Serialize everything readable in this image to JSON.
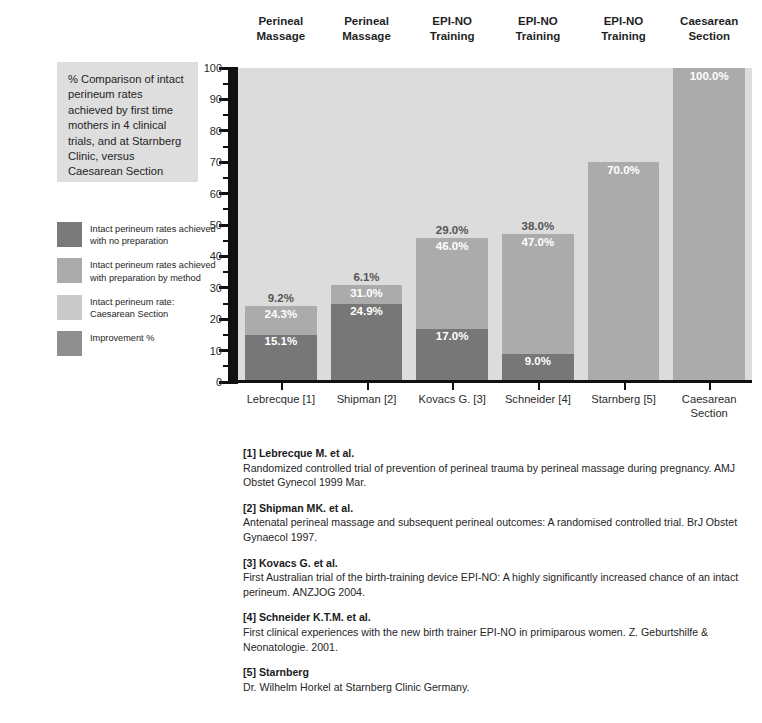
{
  "column_headers": [
    {
      "line1": "Perineal",
      "line2": "Massage"
    },
    {
      "line1": "Perineal",
      "line2": "Massage"
    },
    {
      "line1": "EPI-NO",
      "line2": "Training"
    },
    {
      "line1": "EPI-NO",
      "line2": "Training"
    },
    {
      "line1": "EPI-NO",
      "line2": "Training"
    },
    {
      "line1": "Caesarean",
      "line2": "Section"
    }
  ],
  "title_box": {
    "text": "% Comparison of intact perineum rates achieved by first time mothers in 4 clinical trials, and at Starnberg Clinic, versus Caesarean Section"
  },
  "legend": {
    "items": [
      {
        "label": "Intact perineum rates achieved with no preparation",
        "color": "#7a7a7a"
      },
      {
        "label": "Intact perineum rates achieved with preparation by method",
        "color": "#ababab"
      },
      {
        "label": "Intact perineum rate: Caesarean Section",
        "color": "#c9c9c9"
      },
      {
        "label": "Improvement %",
        "color": "#8f8f8f"
      }
    ]
  },
  "colors": {
    "plot_background": "#dcdcdc",
    "base_segment": "#777777",
    "prepared_segment": "#ababab",
    "axis": "#111111",
    "label_light": "#ffffff",
    "label_dark": "#555555"
  },
  "chart_data": {
    "type": "bar",
    "title": "% Comparison of intact perineum rates achieved by first time mothers in 4 clinical trials, and at Starnberg Clinic, versus Caesarean Section",
    "xlabel": "",
    "ylabel": "",
    "ylim": [
      0,
      100
    ],
    "ytick_major": [
      0,
      10,
      20,
      30,
      40,
      50,
      60,
      70,
      80,
      90,
      100
    ],
    "ytick_minor": [
      5,
      15,
      25,
      35,
      45,
      55,
      65,
      75,
      85,
      95
    ],
    "grid": false,
    "legend_position": "left",
    "stacked": true,
    "categories": [
      {
        "line1": "Lebrecque [1]",
        "line2": ""
      },
      {
        "line1": "Shipman [2]",
        "line2": ""
      },
      {
        "line1": "Kovacs G. [3]",
        "line2": ""
      },
      {
        "line1": "Schneider [4]",
        "line2": ""
      },
      {
        "line1": "Starnberg [5]",
        "line2": ""
      },
      {
        "line1": "Caesarean",
        "line2": "Section"
      }
    ],
    "series": [
      {
        "name": "Intact perineum rates achieved with no preparation",
        "values": [
          15.1,
          24.9,
          17.0,
          9.0,
          null,
          null
        ],
        "labels": [
          "15.1%",
          "24.9%",
          "17.0%",
          "9.0%",
          "",
          ""
        ]
      },
      {
        "name": "Intact perineum rates achieved with preparation by method",
        "values": [
          24.3,
          31.0,
          46.0,
          47.0,
          70.0,
          100.0
        ],
        "labels": [
          "24.3%",
          "31.0%",
          "46.0%",
          "47.0%",
          "70.0%",
          "100.0%"
        ]
      }
    ],
    "improvement": {
      "name": "Improvement %",
      "values": [
        9.2,
        6.1,
        29.0,
        38.0,
        null,
        null
      ],
      "labels": [
        "9.2%",
        "6.1%",
        "29.0%",
        "38.0%",
        "",
        ""
      ]
    },
    "bars": [
      {
        "category": "Lebrecque [1]",
        "base": 15.1,
        "base_label": "15.1%",
        "top": 24.3,
        "top_label": "24.3%",
        "improvement": 9.2,
        "improvement_label": "9.2%"
      },
      {
        "category": "Shipman [2]",
        "base": 24.9,
        "base_label": "24.9%",
        "top": 31.0,
        "top_label": "31.0%",
        "improvement": 6.1,
        "improvement_label": "6.1%"
      },
      {
        "category": "Kovacs G. [3]",
        "base": 17.0,
        "base_label": "17.0%",
        "top": 46.0,
        "top_label": "46.0%",
        "improvement": 29.0,
        "improvement_label": "29.0%"
      },
      {
        "category": "Schneider [4]",
        "base": 9.0,
        "base_label": "9.0%",
        "top": 47.0,
        "top_label": "47.0%",
        "improvement": 38.0,
        "improvement_label": "38.0%"
      },
      {
        "category": "Starnberg [5]",
        "base": 0,
        "base_label": "",
        "top": 70.0,
        "top_label": "70.0%",
        "improvement": null,
        "improvement_label": ""
      },
      {
        "category": "Caesarean Section",
        "base": 0,
        "base_label": "",
        "top": 100.0,
        "top_label": "100.0%",
        "improvement": null,
        "improvement_label": ""
      }
    ]
  },
  "references": [
    {
      "title": "[1] Lebrecque M. et al.",
      "body": "Randomized controlled trial of prevention of perineal trauma by perineal massage during pregnancy. AMJ Obstet Gynecol 1999 Mar."
    },
    {
      "title": "[2] Shipman MK. et al.",
      "body": "Antenatal perineal massage and subsequent perineal outcomes: A randomised controlled trial. BrJ Obstet Gynaecol 1997."
    },
    {
      "title": "[3] Kovacs G. et al.",
      "body": "First Australian trial of the birth-training device EPI-NO: A highly significantly increased chance of an intact perineum. ANZJOG 2004."
    },
    {
      "title": "[4] Schneider K.T.M. et al.",
      "body": "First clinical experiences with the new birth trainer EPI-NO in primiparous women. Z. Geburtshilfe & Neonatologie. 2001."
    },
    {
      "title": "[5] Starnberg",
      "body": "Dr. Wilhelm Horkel at Starnberg Clinic Germany."
    }
  ]
}
